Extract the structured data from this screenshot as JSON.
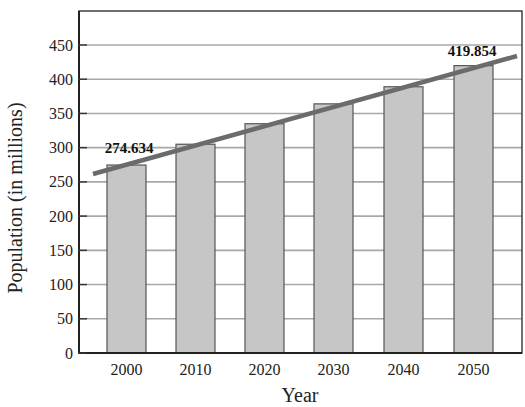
{
  "chart_data": {
    "type": "bar",
    "title": "",
    "xlabel": "Year",
    "ylabel": "Population (in millions)",
    "categories": [
      "2000",
      "2010",
      "2020",
      "2030",
      "2040",
      "2050"
    ],
    "values": [
      274.634,
      305,
      335,
      364,
      389,
      419.854
    ],
    "ylim": [
      0,
      450
    ],
    "yticks": [
      0,
      50,
      100,
      150,
      200,
      250,
      300,
      350,
      400,
      450
    ],
    "grid": true,
    "legend": null,
    "annotations": [
      {
        "category": "2000",
        "text": "274.634"
      },
      {
        "category": "2050",
        "text": "419.854"
      }
    ],
    "trend_line": {
      "from": {
        "x": 1995,
        "y": 263
      },
      "to": {
        "x": 2055,
        "y": 432
      }
    },
    "colors": {
      "bar_fill": "#c6c6c6",
      "bar_stroke": "#555555",
      "grid": "#a8a8a8",
      "axis": "#333333",
      "trend_line": "#6b6b6b"
    }
  }
}
